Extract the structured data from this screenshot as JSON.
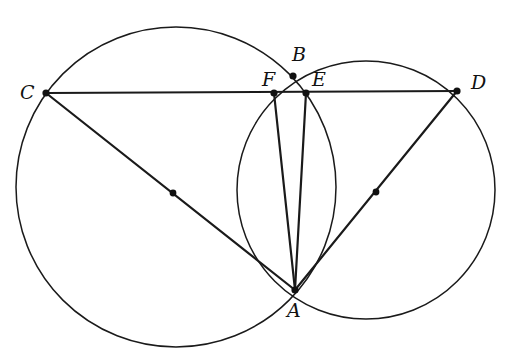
{
  "diagram": {
    "type": "geometry",
    "stroke_color": "#1a1a1a",
    "background": "#ffffff",
    "points": {
      "A": {
        "label": "A",
        "x": 295,
        "y": 290
      },
      "B": {
        "label": "B",
        "x": 293,
        "y": 76
      },
      "C": {
        "label": "C",
        "x": 46,
        "y": 93
      },
      "D": {
        "label": "D",
        "x": 457,
        "y": 91
      },
      "E": {
        "label": "E",
        "x": 306,
        "y": 93
      },
      "F": {
        "label": "F",
        "x": 274,
        "y": 93
      }
    },
    "circles": [
      {
        "name": "left-circle",
        "cx": 176,
        "cy": 187,
        "r": 160,
        "center_dot": {
          "x": 173,
          "y": 193
        }
      },
      {
        "name": "right-circle",
        "cx": 366,
        "cy": 190,
        "r": 129,
        "center_dot": {
          "x": 376,
          "y": 192
        }
      }
    ],
    "segments": [
      [
        "C",
        "D"
      ],
      [
        "C",
        "A"
      ],
      [
        "D",
        "A"
      ],
      [
        "F",
        "A"
      ],
      [
        "E",
        "A"
      ]
    ]
  }
}
